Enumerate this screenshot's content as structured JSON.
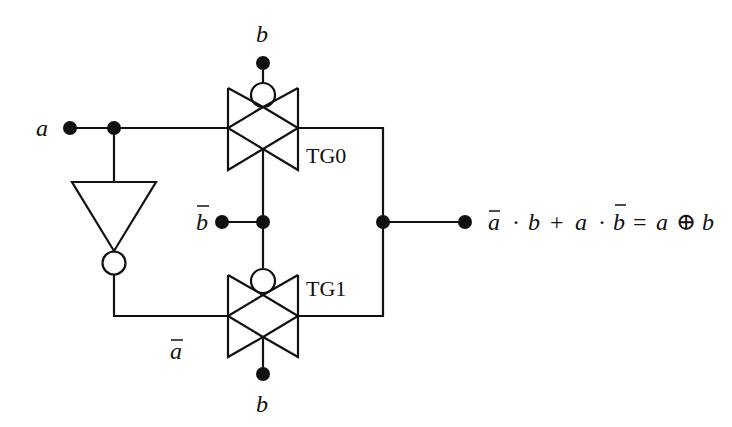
{
  "diagram": {
    "labels": {
      "input_a": "a",
      "top_b": "b",
      "bottom_b": "b",
      "b_bar": "b",
      "a_bar": "a",
      "tg0": "TG0",
      "tg1": "TG1"
    },
    "output_expression": {
      "t1": "a",
      "dot1": "·",
      "t2": "b",
      "plus": "+",
      "t3": "a",
      "dot2": "·",
      "t4": "b",
      "eq": "=",
      "t5": "a",
      "xor": "⊕",
      "t6": "b",
      "plain": "ā · b + a · b̄ = a ⊕ b"
    },
    "components": [
      {
        "type": "input-terminal",
        "name": "a"
      },
      {
        "type": "inverter",
        "input": "a",
        "output": "ā"
      },
      {
        "type": "transmission-gate",
        "name": "TG0",
        "input": "a",
        "control_inverted": "b",
        "control": "b̄"
      },
      {
        "type": "transmission-gate",
        "name": "TG1",
        "input": "ā",
        "control_inverted": "b̄",
        "control": "b"
      },
      {
        "type": "output-terminal",
        "expression": "ā · b + a · b̄ = a ⊕ b"
      }
    ],
    "colors": {
      "stroke": "#111111",
      "background": "#ffffff"
    }
  }
}
